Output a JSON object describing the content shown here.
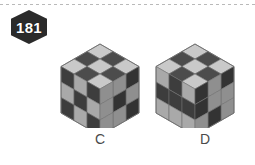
{
  "page": {
    "width": 255,
    "height": 165,
    "background": "#ffffff",
    "divider_style": "dashed"
  },
  "badge": {
    "name": "question-number-badge",
    "number": "181",
    "shape": "hexagon",
    "fill": "#2b2b2b",
    "text_color": "#ffffff"
  },
  "palette": {
    "dark_top": "#4c4c4c",
    "dark_left": "#3d3d3d",
    "dark_right": "#333333",
    "light_top": "#c9c9c9",
    "light_left": "#a9a9a9",
    "light_right": "#8f8f8f",
    "outline": "#6e6e6e",
    "label_color": "#4a4a4a"
  },
  "figures": [
    {
      "id": "cube-c",
      "label": "C",
      "type": "isometric-cube",
      "size": 3,
      "faces": {
        "top": [
          [
            "light",
            "dark",
            "light"
          ],
          [
            "dark",
            "light",
            "dark"
          ],
          [
            "light",
            "dark",
            "light"
          ]
        ],
        "left": [
          [
            "dark",
            "light",
            "dark"
          ],
          [
            "light",
            "dark",
            "light"
          ],
          [
            "dark",
            "light",
            "dark"
          ]
        ],
        "right": [
          [
            "dark",
            "light",
            "light"
          ],
          [
            "light",
            "dark",
            "light"
          ],
          [
            "dark",
            "light",
            "light"
          ]
        ]
      }
    },
    {
      "id": "cube-d",
      "label": "D",
      "type": "isometric-cube",
      "size": 3,
      "faces": {
        "top": [
          [
            "light",
            "dark",
            "light"
          ],
          [
            "dark",
            "light",
            "dark"
          ],
          [
            "light",
            "dark",
            "light"
          ]
        ],
        "left": [
          [
            "light",
            "dark",
            "light"
          ],
          [
            "dark",
            "dark",
            "dark"
          ],
          [
            "light",
            "light",
            "light"
          ]
        ],
        "right": [
          [
            "dark",
            "light",
            "dark"
          ],
          [
            "light",
            "light",
            "dark"
          ],
          [
            "light",
            "dark",
            "light"
          ]
        ]
      }
    }
  ]
}
